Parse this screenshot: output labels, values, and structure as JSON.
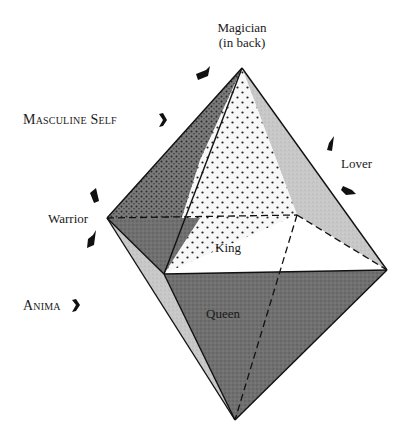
{
  "labels": {
    "magician_line1": "Magician",
    "magician_line2": "(in back)",
    "masculine_self": "Masculine Self",
    "lover": "Lover",
    "warrior": "Warrior",
    "king": "King",
    "anima": "Anima",
    "queen": "Queen"
  },
  "colors": {
    "background": "#ffffff",
    "outline": "#111111",
    "warrior_face": "#6d6d6d",
    "magician_face": "#f4f4f4",
    "lover_face": "#c4c4c4",
    "king_face": "#ffffff",
    "queen_face": "#747474",
    "anima_face": "#d8d8d8"
  },
  "icons": {
    "arrow_glyph": "arrow-pointer-icon"
  }
}
